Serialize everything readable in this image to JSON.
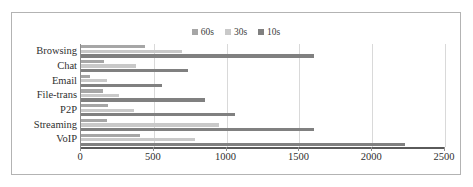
{
  "chart_data": {
    "type": "bar",
    "orientation": "horizontal",
    "title": "",
    "xlabel": "",
    "ylabel": "",
    "xlim": [
      0,
      2500
    ],
    "xticks": [
      0,
      500,
      1000,
      1500,
      2000,
      2500
    ],
    "xtick_labels": [
      "0",
      "500",
      "1000",
      "1500",
      "2000",
      "2500"
    ],
    "grid": true,
    "legend_position": "top-center",
    "categories": [
      "Browsing",
      "Chat",
      "Email",
      "File-trans",
      "P2P",
      "Streaming",
      "VoIP"
    ],
    "series": [
      {
        "name": "60s",
        "color": "#a6a6a6",
        "values": [
          440,
          158,
          62,
          151,
          185,
          178,
          405
        ]
      },
      {
        "name": "30s",
        "color": "#c9c9c9",
        "values": [
          694,
          377,
          178,
          261,
          364,
          948,
          783
        ]
      },
      {
        "name": "10s",
        "color": "#808080",
        "values": [
          1600,
          735,
          556,
          852,
          1058,
          1600,
          2225
        ]
      }
    ]
  },
  "legend": {
    "items": [
      {
        "label": "60s",
        "color": "#a6a6a6"
      },
      {
        "label": "30s",
        "color": "#c9c9c9"
      },
      {
        "label": "10s",
        "color": "#808080"
      }
    ]
  },
  "colors": {
    "frame_border": "#b3b3b3",
    "gridline": "#d9d9d9",
    "axis": "#5a5a5a",
    "text": "#2f2f2f"
  }
}
